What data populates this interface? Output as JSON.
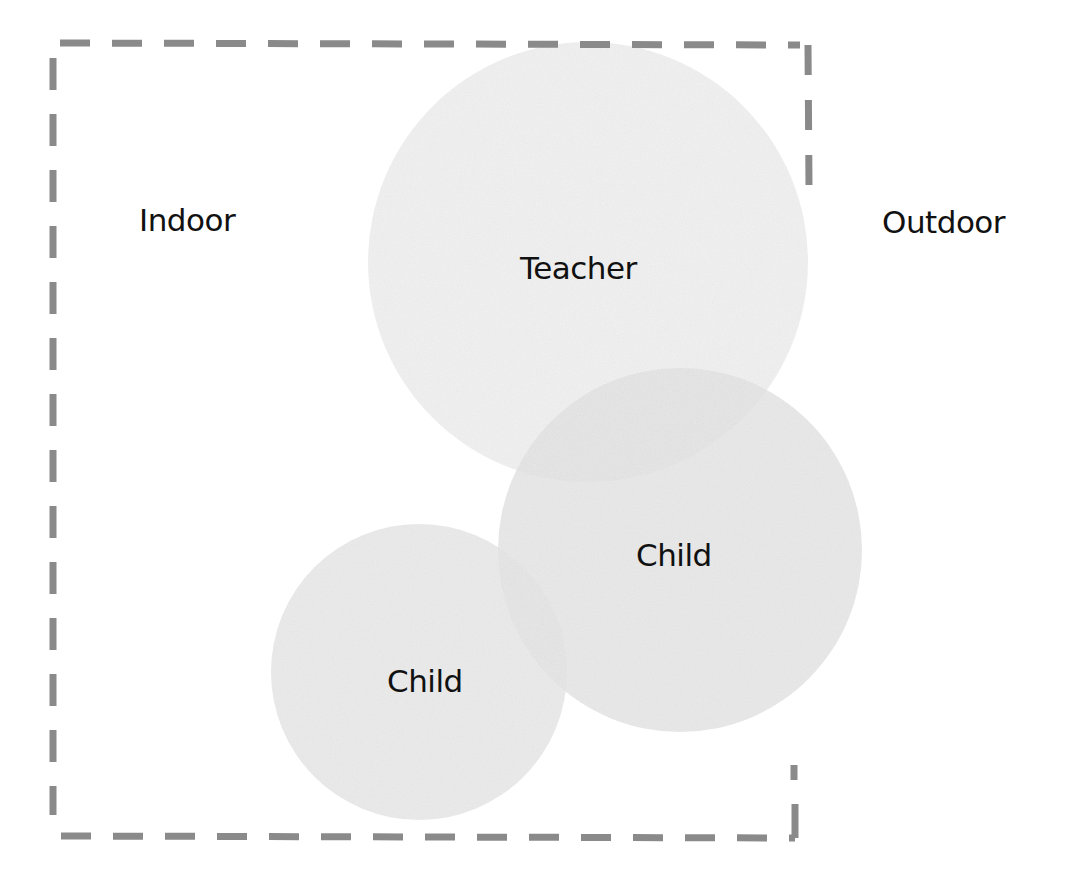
{
  "diagram": {
    "regions": {
      "indoor_label": "Indoor",
      "outdoor_label": "Outdoor"
    },
    "nodes": [
      {
        "id": "teacher",
        "label": "Teacher",
        "shape": "circle",
        "cx": 588,
        "cy": 262,
        "r": 220
      },
      {
        "id": "child_right",
        "label": "Child",
        "shape": "circle",
        "cx": 680,
        "cy": 550,
        "r": 182
      },
      {
        "id": "child_left",
        "label": "Child",
        "shape": "circle",
        "cx": 419,
        "cy": 672,
        "r": 148
      }
    ],
    "boundary": {
      "style": "dashed",
      "meaning": "indoor area"
    }
  },
  "colors": {
    "background": "#ffffff",
    "circle_fill": "#dcdcdc",
    "dash_stroke": "#8a8a8a",
    "text": "#111111"
  }
}
